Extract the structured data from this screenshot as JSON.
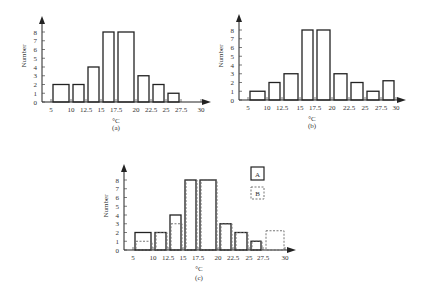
{
  "chart_data": [
    {
      "id": "a",
      "type": "bar",
      "title": "",
      "caption": "(a)",
      "xlabel": "°C",
      "ylabel": "Number",
      "x_ticks": [
        "5",
        "10",
        "12.5",
        "15",
        "17.5",
        "20",
        "22.5",
        "25",
        "27.5",
        "30"
      ],
      "y_ticks": [
        "0",
        "1",
        "2",
        "3",
        "4",
        "5",
        "6",
        "7",
        "8"
      ],
      "bins": [
        [
          5,
          10
        ],
        [
          10,
          12.5
        ],
        [
          12.5,
          15
        ],
        [
          15,
          17.5
        ],
        [
          17.5,
          20
        ],
        [
          20,
          22.5
        ],
        [
          22.5,
          25
        ],
        [
          25,
          27.5
        ],
        [
          27.5,
          30
        ]
      ],
      "values": [
        2,
        2,
        4,
        8,
        8,
        3,
        2,
        1,
        0
      ],
      "ylim": [
        0,
        8
      ],
      "grid": false
    },
    {
      "id": "b",
      "type": "bar",
      "title": "",
      "caption": "(b)",
      "xlabel": "°C",
      "ylabel": "Number",
      "x_ticks": [
        "5",
        "10",
        "12.5",
        "15",
        "17.5",
        "20",
        "22.5",
        "25",
        "27.5",
        "30"
      ],
      "y_ticks": [
        "0",
        "1",
        "2",
        "3",
        "4",
        "5",
        "6",
        "7",
        "8"
      ],
      "bins": [
        [
          5,
          10
        ],
        [
          10,
          12.5
        ],
        [
          12.5,
          15
        ],
        [
          15,
          17.5
        ],
        [
          17.5,
          20
        ],
        [
          20,
          22.5
        ],
        [
          22.5,
          25
        ],
        [
          25,
          27.5
        ],
        [
          27.5,
          30
        ]
      ],
      "values": [
        1,
        2,
        3,
        8,
        8,
        3,
        2,
        1,
        2.2
      ],
      "ylim": [
        0,
        8
      ],
      "grid": false
    },
    {
      "id": "c",
      "type": "bar",
      "title": "",
      "caption": "(c)",
      "xlabel": "°C",
      "ylabel": "Number",
      "x_ticks": [
        "5",
        "10",
        "12.5",
        "15",
        "17.5",
        "20",
        "22.5",
        "25",
        "27.5",
        "30"
      ],
      "y_ticks": [
        "0",
        "1",
        "2",
        "3",
        "4",
        "5",
        "6",
        "7",
        "8"
      ],
      "bins": [
        [
          5,
          10
        ],
        [
          10,
          12.5
        ],
        [
          12.5,
          15
        ],
        [
          15,
          17.5
        ],
        [
          17.5,
          20
        ],
        [
          20,
          22.5
        ],
        [
          22.5,
          25
        ],
        [
          25,
          27.5
        ],
        [
          27.5,
          30
        ]
      ],
      "series": [
        {
          "name": "A",
          "style": "solid",
          "values": [
            2,
            2,
            4,
            8,
            8,
            3,
            2,
            1,
            0
          ]
        },
        {
          "name": "B",
          "style": "dashed",
          "values": [
            1,
            2,
            3,
            8,
            8,
            3,
            2,
            1,
            2.2
          ]
        }
      ],
      "legend": [
        "A",
        "B"
      ],
      "legend_position": "upper right",
      "ylim": [
        0,
        8
      ],
      "grid": false
    }
  ]
}
